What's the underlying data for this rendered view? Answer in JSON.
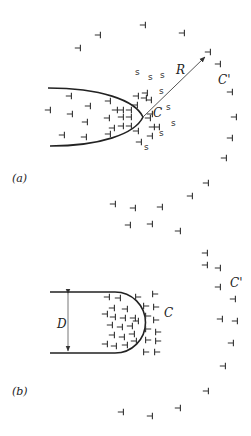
{
  "panel_a": {
    "label": "(a)",
    "crack_tip_label": "C",
    "outer_label": "C'",
    "radius_label": "R",
    "solute_symbol": "s",
    "dislocation_symbol": "⊣",
    "dislocations_left": [
      [
        48,
        110
      ],
      [
        69,
        96
      ],
      [
        70,
        114
      ],
      [
        88,
        106
      ],
      [
        85,
        122
      ],
      [
        62,
        135
      ],
      [
        84,
        137
      ],
      [
        108,
        101
      ],
      [
        115,
        110
      ],
      [
        107,
        118
      ],
      [
        112,
        128
      ],
      [
        108,
        134
      ],
      [
        121,
        110
      ],
      [
        129,
        110
      ],
      [
        121,
        117
      ],
      [
        129,
        117
      ],
      [
        121,
        126
      ],
      [
        129,
        126
      ],
      [
        145,
        93
      ],
      [
        144,
        98
      ],
      [
        149,
        100
      ],
      [
        136,
        96
      ],
      [
        135,
        105
      ],
      [
        148,
        118
      ],
      [
        136,
        131
      ],
      [
        150,
        136
      ],
      [
        139,
        142
      ],
      [
        152,
        127
      ],
      [
        157,
        127
      ],
      [
        150,
        114
      ]
    ],
    "solutes": [
      [
        135,
        75
      ],
      [
        148,
        80
      ],
      [
        160,
        78
      ],
      [
        159,
        94
      ],
      [
        166,
        110
      ],
      [
        171,
        126
      ],
      [
        159,
        136
      ],
      [
        144,
        150
      ]
    ],
    "outer_ring": [
      [
        98,
        35
      ],
      [
        143,
        25
      ],
      [
        182,
        33
      ],
      [
        78,
        48
      ],
      [
        208,
        52
      ],
      [
        218,
        64
      ],
      [
        230,
        92
      ],
      [
        234,
        117
      ],
      [
        230,
        138
      ],
      [
        224,
        158
      ],
      [
        206,
        183
      ],
      [
        190,
        196
      ],
      [
        113,
        204
      ],
      [
        133,
        208
      ],
      [
        160,
        207
      ],
      [
        128,
        225
      ],
      [
        150,
        224
      ],
      [
        178,
        231
      ]
    ]
  },
  "panel_b": {
    "label": "(b)",
    "tip_label": "C",
    "outer_label": "C'",
    "diameter_label": "D",
    "dislocations_inside": [
      [
        107,
        297
      ],
      [
        118,
        298
      ],
      [
        112,
        308
      ],
      [
        125,
        309
      ],
      [
        105,
        314
      ],
      [
        113,
        317
      ],
      [
        123,
        318
      ],
      [
        133,
        318
      ],
      [
        110,
        325
      ],
      [
        120,
        327
      ],
      [
        130,
        326
      ],
      [
        136,
        321
      ],
      [
        112,
        335
      ],
      [
        122,
        337
      ],
      [
        132,
        334
      ],
      [
        105,
        344
      ],
      [
        114,
        346
      ],
      [
        125,
        345
      ],
      [
        134,
        341
      ]
    ],
    "dislocations_outside": [
      [
        138,
        297
      ],
      [
        155,
        294
      ],
      [
        146,
        306
      ],
      [
        156,
        307
      ],
      [
        148,
        316
      ],
      [
        156,
        320
      ],
      [
        148,
        329
      ],
      [
        158,
        332
      ],
      [
        148,
        340
      ],
      [
        158,
        341
      ],
      [
        146,
        352
      ],
      [
        157,
        352
      ]
    ],
    "outer_ring": [
      [
        205,
        253
      ],
      [
        205,
        265
      ],
      [
        218,
        268
      ],
      [
        218,
        287
      ],
      [
        233,
        299
      ],
      [
        220,
        319
      ],
      [
        235,
        321
      ],
      [
        231,
        343
      ],
      [
        223,
        366
      ],
      [
        206,
        391
      ],
      [
        121,
        412
      ],
      [
        150,
        416
      ],
      [
        178,
        408
      ]
    ]
  }
}
